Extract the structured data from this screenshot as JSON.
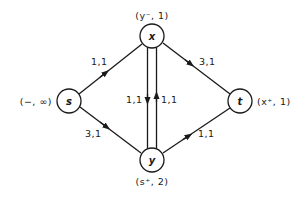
{
  "diagram": {
    "type": "flow-network",
    "nodes": [
      {
        "id": "s",
        "label": "s",
        "annotation": "(−, ∞)"
      },
      {
        "id": "x",
        "label": "x",
        "annotation": "(y⁻, 1)"
      },
      {
        "id": "y",
        "label": "y",
        "annotation": "(s⁺, 2)"
      },
      {
        "id": "t",
        "label": "t",
        "annotation": "(x⁺, 1)"
      }
    ],
    "edges": [
      {
        "from": "s",
        "to": "x",
        "label": "1,1"
      },
      {
        "from": "s",
        "to": "y",
        "label": "3,1"
      },
      {
        "from": "x",
        "to": "t",
        "label": "3,1"
      },
      {
        "from": "y",
        "to": "t",
        "label": "1,1"
      },
      {
        "from": "x",
        "to": "y",
        "label": "1,1"
      },
      {
        "from": "y",
        "to": "x",
        "label": "1,1"
      }
    ]
  }
}
